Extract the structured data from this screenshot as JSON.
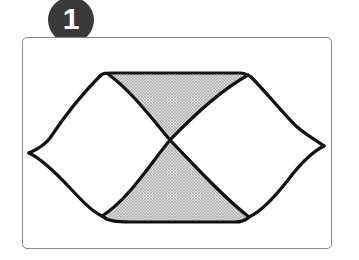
{
  "badge": {
    "number": "1",
    "color": "#3a3a3a"
  },
  "figure": {
    "stroke_color": "#111111",
    "shade_color": "#bdbdbd",
    "frame_color": "#8a8a8a"
  }
}
